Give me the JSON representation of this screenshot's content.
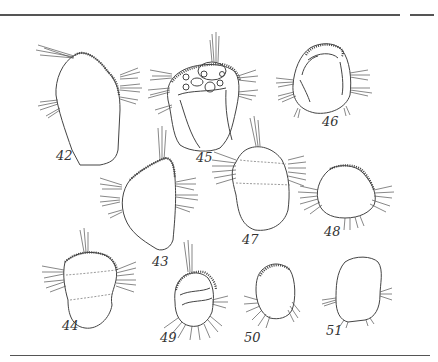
{
  "plate": {
    "description": "Scientific illustration plate of ciliate organisms",
    "figures": [
      {
        "id": "fig-42",
        "label": "42"
      },
      {
        "id": "fig-43",
        "label": "43"
      },
      {
        "id": "fig-44",
        "label": "44"
      },
      {
        "id": "fig-45",
        "label": "45"
      },
      {
        "id": "fig-46",
        "label": "46"
      },
      {
        "id": "fig-47",
        "label": "47"
      },
      {
        "id": "fig-48",
        "label": "48"
      },
      {
        "id": "fig-49",
        "label": "49"
      },
      {
        "id": "fig-50",
        "label": "50"
      },
      {
        "id": "fig-51",
        "label": "51"
      }
    ],
    "colors": {
      "ink": "#444444",
      "paper": "#ffffff",
      "rule": "#555555"
    }
  }
}
